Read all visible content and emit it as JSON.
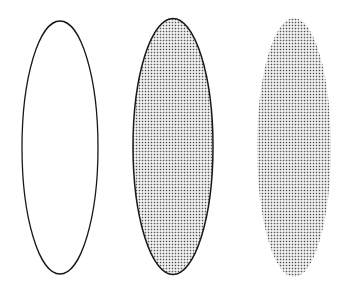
{
  "canvas": {
    "width": 347,
    "height": 291,
    "background": "#ffffff"
  },
  "pattern": {
    "dot_color": "#555555",
    "spacing": 3,
    "dot_size": 1.6
  },
  "shapes": [
    {
      "id": "ellipse-outline",
      "description": "Ellipse with black outline, no fill",
      "cx": 60,
      "cy": 147.5,
      "rx": 38,
      "ry": 126.5,
      "stroke": "#1a1a1a",
      "stroke_width": 1.3,
      "fill": "none"
    },
    {
      "id": "ellipse-outline-filled",
      "description": "Ellipse with black outline and dotted gray pattern fill",
      "cx": 173,
      "cy": 146.5,
      "rx": 40,
      "ry": 128,
      "stroke": "#1a1a1a",
      "stroke_width": 1.5,
      "fill": "dots"
    },
    {
      "id": "ellipse-filled",
      "description": "Ellipse with dotted gray pattern fill, no outline",
      "cx": 294,
      "cy": 147.5,
      "rx": 37,
      "ry": 129.5,
      "stroke": "none",
      "stroke_width": 0,
      "fill": "dots"
    }
  ]
}
